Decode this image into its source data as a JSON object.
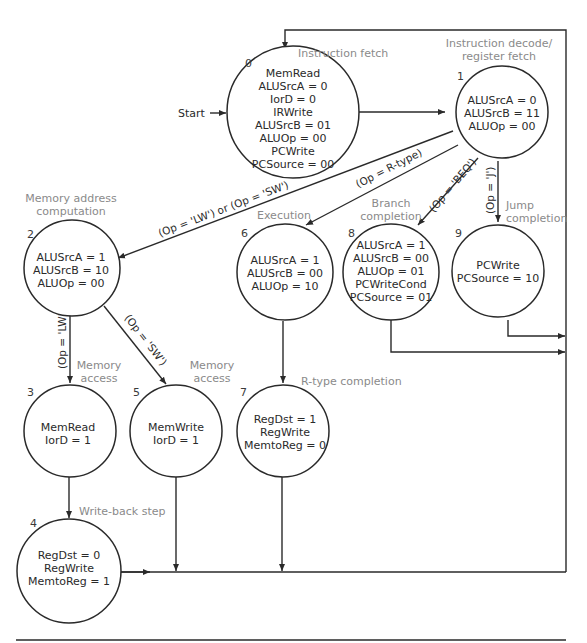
{
  "start_label": "Start",
  "states": [
    {
      "id": "0",
      "caption": [
        "Instruction fetch"
      ],
      "lines": [
        "MemRead",
        "ALUSrcA = 0",
        "IorD = 0",
        "IRWrite",
        "ALUSrcB = 01",
        "ALUOp = 00",
        "PCWrite",
        "PCSource = 00"
      ]
    },
    {
      "id": "1",
      "caption": [
        "Instruction decode/",
        "register fetch"
      ],
      "lines": [
        "ALUSrcA = 0",
        "ALUSrcB = 11",
        "ALUOp = 00"
      ]
    },
    {
      "id": "2",
      "caption": [
        "Memory address",
        "computation"
      ],
      "lines": [
        "ALUSrcA = 1",
        "ALUSrcB = 10",
        "ALUOp = 00"
      ]
    },
    {
      "id": "3",
      "caption": [
        "Memory",
        "access"
      ],
      "lines": [
        "MemRead",
        "IorD = 1"
      ]
    },
    {
      "id": "4",
      "caption": [
        "Write-back step"
      ],
      "lines": [
        "RegDst = 0",
        "RegWrite",
        "MemtoReg = 1"
      ]
    },
    {
      "id": "5",
      "caption": [
        "Memory",
        "access"
      ],
      "lines": [
        "MemWrite",
        "IorD = 1"
      ]
    },
    {
      "id": "6",
      "caption": [
        "Execution"
      ],
      "lines": [
        "ALUSrcA = 1",
        "ALUSrcB = 00",
        "ALUOp = 10"
      ]
    },
    {
      "id": "7",
      "caption": [
        "R-type completion"
      ],
      "lines": [
        "RegDst = 1",
        "RegWrite",
        "MemtoReg = 0"
      ]
    },
    {
      "id": "8",
      "caption": [
        "Branch",
        "completion"
      ],
      "lines": [
        "ALUSrcA = 1",
        "ALUSrcB = 00",
        "ALUOp = 01",
        "PCWriteCond",
        "PCSource = 01"
      ]
    },
    {
      "id": "9",
      "caption": [
        "Jump",
        "completion"
      ],
      "lines": [
        "PCWrite",
        "PCSource = 10"
      ]
    }
  ],
  "transitions": {
    "lw_sw": "(Op = 'LW') or (Op = 'SW')",
    "rtype": "(Op = R-type)",
    "beq": "(Op = 'BEQ')",
    "j": "(Op = 'J')",
    "lw": "(Op = 'LW')",
    "sw": "(Op = 'SW')"
  }
}
